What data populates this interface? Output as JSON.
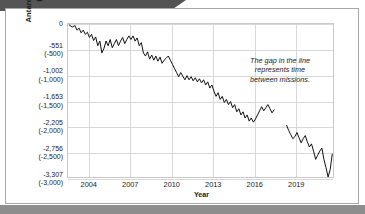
{
  "chart_data": {
    "type": "line",
    "title": "",
    "xlabel": "Year",
    "ylabel": "Antarctica Mass, U.S. Gigaton (Metric Gigatonne)",
    "ylabel_line1": "Antarctica Mass, U.S. Gigaton",
    "ylabel_line2": "(Metric Gigatonne)",
    "grid": true,
    "legend": "none",
    "xlim": [
      2002.5,
      2021.8
    ],
    "ylim": [
      -3000,
      0
    ],
    "xticks": [
      "2004",
      "2007",
      "2010",
      "2013",
      "2016",
      "2019"
    ],
    "xtick_values": [
      2004,
      2007,
      2010,
      2013,
      2016,
      2019
    ],
    "yticks": [
      {
        "us": "0",
        "metric": ""
      },
      {
        "us": "-551",
        "metric": "(-500)"
      },
      {
        "us": "-1,002",
        "metric": "(-1,000)"
      },
      {
        "us": "-1,653",
        "metric": "(-1,500)"
      },
      {
        "us": "-2,205",
        "metric": "(-2,000)"
      },
      {
        "us": "-2,756",
        "metric": "(-2,500)"
      },
      {
        "us": "-3,307",
        "metric": "(-3,000)"
      }
    ],
    "ytick_values": [
      0,
      -500,
      -1000,
      -1500,
      -2000,
      -2500,
      -3000
    ],
    "annotation": "The gap in the line represents time between missions.",
    "series": [
      {
        "name": "GRACE mission",
        "x": [
          2002.6,
          2002.8,
          2003.0,
          2003.15,
          2003.3,
          2003.45,
          2003.6,
          2003.75,
          2003.9,
          2004.05,
          2004.2,
          2004.35,
          2004.5,
          2004.65,
          2004.8,
          2004.95,
          2005.1,
          2005.25,
          2005.4,
          2005.55,
          2005.7,
          2005.85,
          2006.0,
          2006.15,
          2006.3,
          2006.45,
          2006.6,
          2006.75,
          2006.9,
          2007.05,
          2007.2,
          2007.35,
          2007.5,
          2007.65,
          2007.8,
          2007.95,
          2008.1,
          2008.25,
          2008.4,
          2008.55,
          2008.7,
          2008.85,
          2009.0,
          2009.15,
          2009.3,
          2009.45,
          2009.6,
          2009.75,
          2009.9,
          2010.05,
          2010.2,
          2010.35,
          2010.5,
          2010.65,
          2010.8,
          2010.95,
          2011.1,
          2011.25,
          2011.4,
          2011.55,
          2011.7,
          2011.85,
          2012.0,
          2012.15,
          2012.3,
          2012.45,
          2012.6,
          2012.75,
          2012.9,
          2013.05,
          2013.2,
          2013.35,
          2013.5,
          2013.65,
          2013.8,
          2013.95,
          2014.1,
          2014.25,
          2014.4,
          2014.55,
          2014.7,
          2014.85,
          2015.0,
          2015.15,
          2015.3,
          2015.45,
          2015.6,
          2015.75,
          2015.9,
          2016.05,
          2016.2,
          2016.35,
          2016.5,
          2016.65,
          2016.8,
          2016.95,
          2017.1,
          2017.25,
          2017.4
        ],
        "y": [
          -20,
          -60,
          -30,
          -120,
          -80,
          -170,
          -120,
          -200,
          -160,
          -260,
          -200,
          -320,
          -250,
          -420,
          -330,
          -560,
          -470,
          -330,
          -420,
          -300,
          -460,
          -380,
          -300,
          -420,
          -330,
          -260,
          -380,
          -300,
          -230,
          -300,
          -230,
          -330,
          -270,
          -420,
          -360,
          -560,
          -620,
          -540,
          -680,
          -600,
          -700,
          -620,
          -720,
          -640,
          -760,
          -700,
          -660,
          -620,
          -700,
          -780,
          -860,
          -940,
          -1020,
          -940,
          -1010,
          -1080,
          -1000,
          -1080,
          -1020,
          -1100,
          -1040,
          -1120,
          -1060,
          -1140,
          -1080,
          -1180,
          -1120,
          -1240,
          -1180,
          -1300,
          -1400,
          -1330,
          -1460,
          -1400,
          -1520,
          -1460,
          -1560,
          -1500,
          -1620,
          -1560,
          -1700,
          -1640,
          -1760,
          -1700,
          -1820,
          -1760,
          -1880,
          -1820,
          -1900,
          -1840,
          -1760,
          -1680,
          -1600,
          -1680,
          -1620,
          -1560,
          -1640,
          -1720,
          -1660
        ]
      },
      {
        "name": "GRACE-FO mission",
        "x": [
          2018.3,
          2018.45,
          2018.6,
          2018.75,
          2018.9,
          2019.05,
          2019.2,
          2019.35,
          2019.5,
          2019.65,
          2019.8,
          2019.95,
          2020.1,
          2020.25,
          2020.4,
          2020.55,
          2020.7,
          2020.85,
          2021.0,
          2021.15,
          2021.3,
          2021.45,
          2021.6
        ],
        "y": [
          -1960,
          -2060,
          -2140,
          -2220,
          -2180,
          -2100,
          -2200,
          -2300,
          -2220,
          -2160,
          -2280,
          -2380,
          -2320,
          -2460,
          -2620,
          -2540,
          -2460,
          -2400,
          -2620,
          -2780,
          -2960,
          -2820,
          -2520
        ]
      }
    ]
  },
  "axes": {
    "y_title_line1": "Antarctica Mass, U.S. Gigaton",
    "y_title_line2": "(Metric Gigatonne)",
    "x_title": "Year"
  },
  "annotation": {
    "line1": "The gap in the line",
    "line2": "represents time",
    "line3": "between missions."
  },
  "colors": {
    "line": "#111111",
    "grid": "#d8d8d8",
    "plot_border": "#c9c9c9",
    "card_border": "#a7a7a7",
    "banner": "#545454",
    "bottom_bar": "#8d8d8d",
    "text": "#1c1c1c",
    "background": "#ffffff"
  }
}
